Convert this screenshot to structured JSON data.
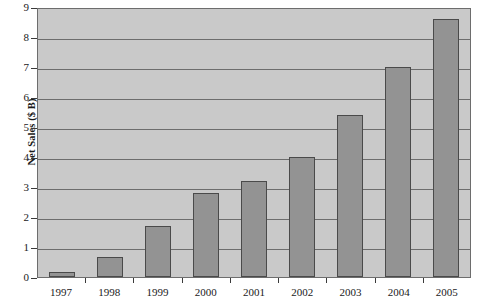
{
  "chart_data": {
    "type": "bar",
    "title": "",
    "subtitle": "",
    "xlabel": "",
    "ylabel": "Net Sales ($ B)",
    "categories": [
      "1997",
      "1998",
      "1999",
      "2000",
      "2001",
      "2002",
      "2003",
      "2004",
      "2005"
    ],
    "values": [
      0.17,
      0.65,
      1.7,
      2.8,
      3.2,
      4.0,
      5.4,
      7.0,
      8.6
    ],
    "ylim": [
      0,
      9
    ],
    "ytick_labels": [
      "9",
      "8",
      "7",
      "6",
      "5",
      "4",
      "3",
      "2",
      "1",
      "0"
    ],
    "ytick_values": [
      9,
      8,
      7,
      6,
      5,
      4,
      3,
      2,
      1,
      0
    ],
    "grid": true,
    "grid_orientation": "horizontal",
    "legend": null,
    "legend_position": "none",
    "series": [
      {
        "name": "Net Sales",
        "values": [
          0.17,
          0.65,
          1.7,
          2.8,
          3.2,
          4.0,
          5.4,
          7.0,
          8.6
        ]
      }
    ],
    "colors": {
      "bar_fill": "#939393",
      "bar_border": "#4a4a4a",
      "plot_background": "#c9c9c9",
      "gridline": "#6d6d6d",
      "axis": "#3a3a3a",
      "text": "#1a1a1a",
      "page_background": "#ffffff"
    }
  }
}
